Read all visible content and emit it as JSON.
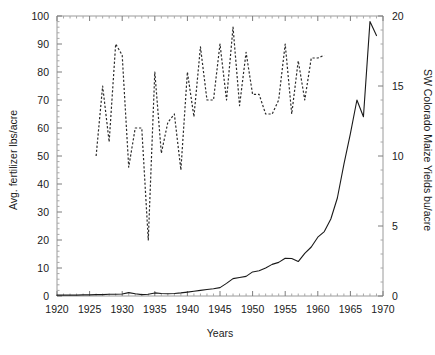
{
  "chart_data": {
    "type": "line",
    "title": "",
    "xlabel": "Years",
    "ylabel": "Avg. fertilizer lbs/acre",
    "y2label": "SW Colorado Maize Yields bu/acre",
    "xlim": [
      1920,
      1970
    ],
    "ylim": [
      0,
      100
    ],
    "y2lim": [
      0,
      20
    ],
    "grid": false,
    "legend": "none",
    "xticks": [
      1920,
      1925,
      1930,
      1935,
      1940,
      1945,
      1950,
      1955,
      1960,
      1965,
      1970
    ],
    "xtick_labels": [
      "1920",
      "1925",
      "1930",
      "1935",
      "1940",
      "1945",
      "1950",
      "1955",
      "1960",
      "1965",
      "1970"
    ],
    "xtick_minor_step": 1,
    "yticks": [
      0,
      10,
      20,
      30,
      40,
      50,
      60,
      70,
      80,
      90,
      100
    ],
    "ytick_labels": [
      "0",
      "10",
      "20",
      "30",
      "40",
      "50",
      "60",
      "70",
      "80",
      "90",
      "100"
    ],
    "ytick_minor_step": 2,
    "y2ticks": [
      0,
      5,
      10,
      15,
      20
    ],
    "y2tick_labels": [
      "0",
      "5",
      "10",
      "15",
      "20"
    ],
    "y2tick_minor_step": 1,
    "series": [
      {
        "name": "Avg. fertilizer lbs/acre",
        "axis": "left",
        "style": "solid",
        "color": "#1a1a1a",
        "x": [
          1920,
          1921,
          1922,
          1923,
          1924,
          1925,
          1926,
          1927,
          1928,
          1929,
          1930,
          1931,
          1932,
          1933,
          1934,
          1935,
          1936,
          1937,
          1938,
          1939,
          1940,
          1941,
          1942,
          1943,
          1944,
          1945,
          1946,
          1947,
          1948,
          1949,
          1950,
          1951,
          1952,
          1953,
          1954,
          1955,
          1956,
          1957,
          1958,
          1959,
          1960,
          1961,
          1962,
          1963,
          1964,
          1965,
          1966,
          1967,
          1968,
          1969
        ],
        "values": [
          0.3,
          0.3,
          0.3,
          0.3,
          0.4,
          0.4,
          0.5,
          0.5,
          0.6,
          0.6,
          0.7,
          1.2,
          0.8,
          0.5,
          0.6,
          1.1,
          0.9,
          0.8,
          0.9,
          1.1,
          1.4,
          1.7,
          2.0,
          2.3,
          2.6,
          3.0,
          4.5,
          6.2,
          6.6,
          7.0,
          8.6,
          9.0,
          10.0,
          11.3,
          12.0,
          13.5,
          13.4,
          12.3,
          15.2,
          17.5,
          21.0,
          23.0,
          27.5,
          35.0,
          47.0,
          58.0,
          70.0,
          64.0,
          98.0,
          93.0
        ]
      },
      {
        "name": "SW Colorado Maize Yields bu/acre",
        "axis": "right",
        "style": "dashed",
        "color": "#2b2b2b",
        "x": [
          1926,
          1927,
          1928,
          1929,
          1930,
          1931,
          1932,
          1933,
          1934,
          1935,
          1936,
          1937,
          1938,
          1939,
          1940,
          1941,
          1942,
          1943,
          1944,
          1945,
          1946,
          1947,
          1948,
          1949,
          1950,
          1951,
          1952,
          1953,
          1954,
          1955,
          1956,
          1957,
          1958,
          1959,
          1960,
          1961
        ],
        "values": [
          10.0,
          15.0,
          11.0,
          18.0,
          17.2,
          9.2,
          12.0,
          12.0,
          4.0,
          16.0,
          10.2,
          12.4,
          13.0,
          9.0,
          16.0,
          12.8,
          17.8,
          14.0,
          14.0,
          18.0,
          14.0,
          19.2,
          13.6,
          17.4,
          14.4,
          14.4,
          13.0,
          13.0,
          14.0,
          18.0,
          13.0,
          16.8,
          14.0,
          17.0,
          17.0,
          17.2
        ]
      }
    ]
  },
  "axes": {
    "left_title": "Avg. fertilizer lbs/acre",
    "right_title": "SW Colorado Maize Yields bu/acre",
    "bottom_title": "Years"
  }
}
